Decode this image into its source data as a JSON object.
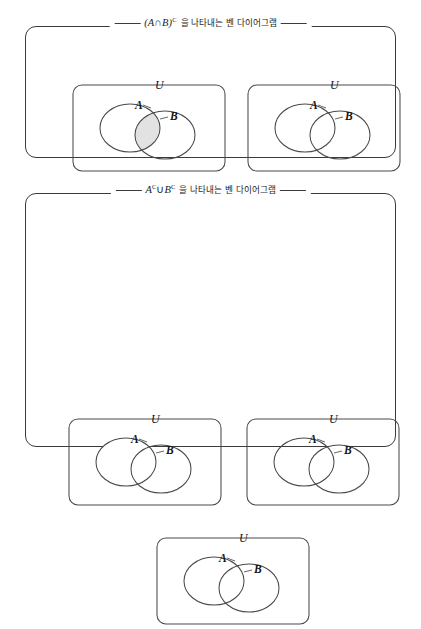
{
  "document": {
    "type": "math-textbook-figure",
    "subject": "set-theory-venn-diagrams",
    "language": "ko"
  },
  "colors": {
    "shaded_fill": "#e2e2e2",
    "unshaded_fill": "#ffffff",
    "stroke": "#4a4a4a",
    "frame_stroke": "#3b3b3b",
    "text": "#141414",
    "page_background": "#ffffff"
  },
  "groups": [
    {
      "id": "group-1",
      "caption": {
        "math_prefix": "(",
        "set_a": "A",
        "operator": "∩",
        "set_b": "B",
        "math_suffix": ")",
        "superscript": "C",
        "korean": "을 나타내는 벤 다이어그램",
        "full_text": "(A∩B)ᶜ을 나타내는 벤 다이어그램"
      },
      "panels": [
        "panel-1",
        "panel-2"
      ]
    },
    {
      "id": "group-2",
      "caption": {
        "math_prefix": "",
        "set_a": "A",
        "operator": "∪",
        "set_b": "B",
        "math_suffix": "",
        "superscript": "C",
        "korean": "을 나타내는 벤 다이어그램",
        "full_text": "Aᶜ∪Bᶜ을 나타내는 벤 다이어그램"
      },
      "panels": [
        "panel-3",
        "panel-4",
        "panel-5"
      ]
    }
  ],
  "panels": [
    {
      "id": "panel-1",
      "group": "group-1",
      "universe_label": "U",
      "set_a_label": "A",
      "set_b_label": "B",
      "universe_shaded": false,
      "region_a_only_shaded": false,
      "region_b_only_shaded": false,
      "region_intersection_shaded": true,
      "represents": "A∩B"
    },
    {
      "id": "panel-2",
      "group": "group-1",
      "universe_label": "U",
      "set_a_label": "A",
      "set_b_label": "B",
      "universe_shaded": true,
      "region_a_only_shaded": true,
      "region_b_only_shaded": true,
      "region_intersection_shaded": false,
      "represents": "(A∩B)ᶜ"
    },
    {
      "id": "panel-3",
      "group": "group-2",
      "universe_label": "U",
      "set_a_label": "A",
      "set_b_label": "B",
      "universe_shaded": true,
      "region_a_only_shaded": false,
      "region_b_only_shaded": true,
      "region_intersection_shaded": false,
      "represents": "Aᶜ"
    },
    {
      "id": "panel-4",
      "group": "group-2",
      "universe_label": "U",
      "set_a_label": "A",
      "set_b_label": "B",
      "universe_shaded": true,
      "region_a_only_shaded": true,
      "region_b_only_shaded": false,
      "region_intersection_shaded": false,
      "represents": "Bᶜ"
    },
    {
      "id": "panel-5",
      "group": "group-2",
      "universe_label": "U",
      "set_a_label": "A",
      "set_b_label": "B",
      "universe_shaded": true,
      "region_a_only_shaded": true,
      "region_b_only_shaded": true,
      "region_intersection_shaded": false,
      "represents": "Aᶜ∪Bᶜ"
    }
  ],
  "geometry": {
    "panel_width": 152,
    "panel_height": 93,
    "panel_radius": 9,
    "circle_a": {
      "cx": 57,
      "cy": 50,
      "rx": 30,
      "ry": 24
    },
    "circle_b": {
      "cx": 92,
      "cy": 57,
      "rx": 30,
      "ry": 24
    },
    "u_label_x": 88,
    "u_label_y": 4
  }
}
